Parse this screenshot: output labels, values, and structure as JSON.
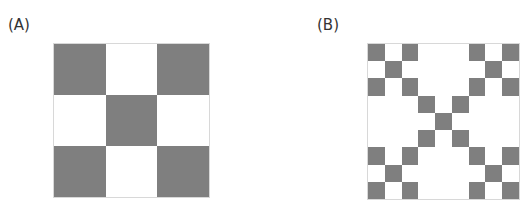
{
  "panels": [
    {
      "label": "(A)",
      "description": "3x3 checkerboard, corners and center dark",
      "pattern": [
        [
          1,
          0,
          1
        ],
        [
          0,
          1,
          0
        ],
        [
          1,
          0,
          1
        ]
      ]
    },
    {
      "label": "(B)",
      "description": "3x3 blocks; dark blocks of A replaced by 3x3 checkerboards, light blocks stay white",
      "pattern": [
        [
          1,
          0,
          1
        ],
        [
          0,
          1,
          0
        ],
        [
          1,
          0,
          1
        ]
      ],
      "subpattern": [
        [
          1,
          0,
          1
        ],
        [
          0,
          1,
          0
        ],
        [
          1,
          0,
          1
        ]
      ]
    }
  ],
  "colors": {
    "dark": "#7f7f7f",
    "light": "#ffffff",
    "border": "#d8d8d8"
  }
}
